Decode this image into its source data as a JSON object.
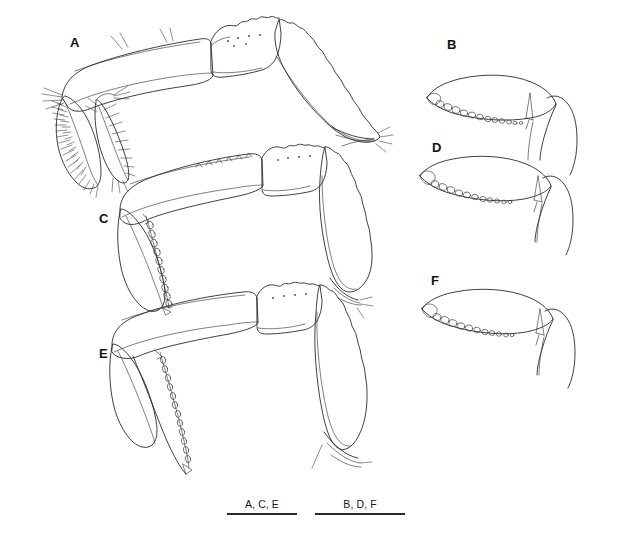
{
  "figure": {
    "background_color": "#ffffff",
    "ink_color": "#2a2a2a",
    "width": 623,
    "height": 542,
    "type": "line-drawing-plate"
  },
  "panels": [
    {
      "id": "A",
      "label": "A",
      "label_x": 70,
      "label_y": 36,
      "description": "whole pereopod with merus, carpus, propodus and serrate dactylus, dense setae on ischium"
    },
    {
      "id": "B",
      "label": "B",
      "label_x": 447,
      "label_y": 38,
      "description": "dactylus with row of rounded denticles"
    },
    {
      "id": "C",
      "label": "C",
      "label_x": 99,
      "label_y": 212,
      "description": "whole pereopod with serrate propodus margin"
    },
    {
      "id": "D",
      "label": "D",
      "label_x": 432,
      "label_y": 141,
      "description": "dactylus with row of rounded denticles"
    },
    {
      "id": "E",
      "label": "E",
      "label_x": 99,
      "label_y": 347,
      "description": "whole pereopod with elongate merus and propodus"
    },
    {
      "id": "F",
      "label": "F",
      "label_x": 431,
      "label_y": 274,
      "description": "dactylus with row of rounded denticles"
    }
  ],
  "scale_bars": [
    {
      "id": "scalebar-left",
      "caption": "A, C, E",
      "x": 227,
      "y": 498,
      "width": 70
    },
    {
      "id": "scalebar-right",
      "caption": "B, D, F",
      "x": 315,
      "y": 498,
      "width": 90
    }
  ]
}
